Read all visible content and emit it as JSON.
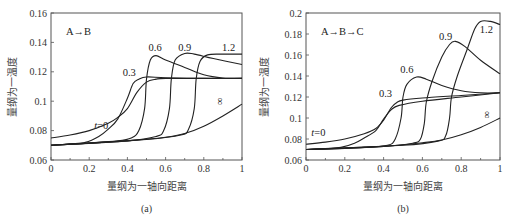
{
  "chart_data": [
    {
      "type": "line",
      "panel_label": "(a)",
      "annotation": "A→B",
      "xlabel": "量纲为一轴向距离",
      "ylabel": "量纲为一温度",
      "xlim": [
        0,
        1
      ],
      "ylim": [
        0.06,
        0.16
      ],
      "xticks": [
        "0",
        "0.2",
        "0.4",
        "0.6",
        "0.8",
        "1"
      ],
      "yticks": [
        "0.06",
        "0.08",
        "0.1",
        "0.12",
        "0.14",
        "0.16"
      ],
      "grid": false,
      "series": [
        {
          "name": "t=0",
          "label_pos": [
            0.3,
            0.081
          ],
          "points": [
            [
              0,
              0.075
            ],
            [
              0.1,
              0.077
            ],
            [
              0.2,
              0.08
            ],
            [
              0.3,
              0.085
            ],
            [
              0.35,
              0.089
            ],
            [
              0.4,
              0.095
            ],
            [
              0.45,
              0.106
            ],
            [
              0.5,
              0.113
            ],
            [
              0.55,
              0.115
            ],
            [
              0.6,
              0.1155
            ],
            [
              0.8,
              0.1155
            ],
            [
              1,
              0.1155
            ]
          ]
        },
        {
          "name": "0.3",
          "label_pos": [
            0.41,
            0.117
          ],
          "points": [
            [
              0,
              0.07
            ],
            [
              0.1,
              0.071
            ],
            [
              0.18,
              0.072
            ],
            [
              0.25,
              0.076
            ],
            [
              0.3,
              0.081
            ],
            [
              0.35,
              0.088
            ],
            [
              0.4,
              0.102
            ],
            [
              0.43,
              0.112
            ],
            [
              0.46,
              0.115
            ],
            [
              0.5,
              0.1165
            ],
            [
              0.6,
              0.116
            ],
            [
              0.8,
              0.1155
            ],
            [
              1,
              0.1155
            ]
          ]
        },
        {
          "name": "0.6",
          "label_pos": [
            0.545,
            0.134
          ],
          "points": [
            [
              0,
              0.07
            ],
            [
              0.2,
              0.0715
            ],
            [
              0.35,
              0.073
            ],
            [
              0.42,
              0.075
            ],
            [
              0.46,
              0.08
            ],
            [
              0.49,
              0.095
            ],
            [
              0.5,
              0.115
            ],
            [
              0.52,
              0.128
            ],
            [
              0.55,
              0.131
            ],
            [
              0.6,
              0.128
            ],
            [
              0.7,
              0.123
            ],
            [
              0.8,
              0.118
            ],
            [
              0.9,
              0.1158
            ],
            [
              1,
              0.1155
            ]
          ]
        },
        {
          "name": "0.9",
          "label_pos": [
            0.7,
            0.134
          ],
          "points": [
            [
              0,
              0.07
            ],
            [
              0.4,
              0.073
            ],
            [
              0.55,
              0.076
            ],
            [
              0.59,
              0.08
            ],
            [
              0.62,
              0.095
            ],
            [
              0.63,
              0.115
            ],
            [
              0.65,
              0.128
            ],
            [
              0.7,
              0.1325
            ],
            [
              0.75,
              0.132
            ],
            [
              0.85,
              0.129
            ],
            [
              1,
              0.125
            ]
          ]
        },
        {
          "name": "1.2",
          "label_pos": [
            0.93,
            0.134
          ],
          "points": [
            [
              0,
              0.07
            ],
            [
              0.5,
              0.074
            ],
            [
              0.68,
              0.077
            ],
            [
              0.72,
              0.081
            ],
            [
              0.75,
              0.095
            ],
            [
              0.76,
              0.115
            ],
            [
              0.78,
              0.127
            ],
            [
              0.82,
              0.1315
            ],
            [
              0.9,
              0.132
            ],
            [
              1,
              0.132
            ]
          ]
        },
        {
          "name": "∞",
          "label_pos": [
            0.9,
            0.1
          ],
          "points": [
            [
              0,
              0.07
            ],
            [
              0.2,
              0.0715
            ],
            [
              0.4,
              0.073
            ],
            [
              0.6,
              0.0755
            ],
            [
              0.7,
              0.078
            ],
            [
              0.8,
              0.083
            ],
            [
              0.9,
              0.09
            ],
            [
              1,
              0.098
            ]
          ]
        }
      ]
    },
    {
      "type": "line",
      "panel_label": "(b)",
      "annotation": "A→B→C",
      "xlabel": "量纲为一轴向距离",
      "ylabel": "量纲为一温度",
      "xlim": [
        0,
        1
      ],
      "ylim": [
        0.06,
        0.2
      ],
      "xticks": [
        "0",
        "0.2",
        "0.4",
        "0.6",
        "0.8",
        "1"
      ],
      "yticks": [
        "0.06",
        "0.08",
        "0.1",
        "0.12",
        "0.14",
        "0.16",
        "0.18",
        "0.2"
      ],
      "grid": false,
      "series": [
        {
          "name": "t=0",
          "label_pos": [
            0.1,
            0.083
          ],
          "points": [
            [
              0,
              0.075
            ],
            [
              0.1,
              0.077
            ],
            [
              0.2,
              0.08
            ],
            [
              0.3,
              0.085
            ],
            [
              0.36,
              0.09
            ],
            [
              0.4,
              0.098
            ],
            [
              0.44,
              0.11
            ],
            [
              0.47,
              0.115
            ],
            [
              0.5,
              0.117
            ],
            [
              0.6,
              0.119
            ],
            [
              0.8,
              0.1215
            ],
            [
              1,
              0.124
            ]
          ]
        },
        {
          "name": "0.3",
          "label_pos": [
            0.41,
            0.12
          ],
          "points": [
            [
              0,
              0.07
            ],
            [
              0.1,
              0.071
            ],
            [
              0.18,
              0.072
            ],
            [
              0.25,
              0.076
            ],
            [
              0.3,
              0.081
            ],
            [
              0.36,
              0.088
            ],
            [
              0.4,
              0.099
            ],
            [
              0.44,
              0.108
            ],
            [
              0.48,
              0.112
            ],
            [
              0.6,
              0.116
            ],
            [
              0.8,
              0.12
            ],
            [
              1,
              0.124
            ]
          ]
        },
        {
          "name": "0.6",
          "label_pos": [
            0.52,
            0.143
          ],
          "points": [
            [
              0,
              0.07
            ],
            [
              0.3,
              0.072
            ],
            [
              0.42,
              0.074
            ],
            [
              0.46,
              0.08
            ],
            [
              0.49,
              0.1
            ],
            [
              0.5,
              0.12
            ],
            [
              0.52,
              0.132
            ],
            [
              0.57,
              0.139
            ],
            [
              0.62,
              0.137
            ],
            [
              0.7,
              0.131
            ],
            [
              0.8,
              0.126
            ],
            [
              0.9,
              0.124
            ],
            [
              1,
              0.124
            ]
          ]
        },
        {
          "name": "0.9",
          "label_pos": [
            0.72,
            0.174
          ],
          "points": [
            [
              0,
              0.07
            ],
            [
              0.4,
              0.073
            ],
            [
              0.55,
              0.076
            ],
            [
              0.59,
              0.08
            ],
            [
              0.61,
              0.095
            ],
            [
              0.62,
              0.115
            ],
            [
              0.65,
              0.135
            ],
            [
              0.7,
              0.158
            ],
            [
              0.74,
              0.17
            ],
            [
              0.77,
              0.173
            ],
            [
              0.82,
              0.168
            ],
            [
              0.9,
              0.155
            ],
            [
              1,
              0.142
            ]
          ]
        },
        {
          "name": "1.2",
          "label_pos": [
            0.93,
            0.181
          ],
          "points": [
            [
              0,
              0.07
            ],
            [
              0.5,
              0.074
            ],
            [
              0.68,
              0.078
            ],
            [
              0.72,
              0.083
            ],
            [
              0.74,
              0.1
            ],
            [
              0.75,
              0.12
            ],
            [
              0.78,
              0.14
            ],
            [
              0.83,
              0.165
            ],
            [
              0.87,
              0.185
            ],
            [
              0.9,
              0.192
            ],
            [
              0.95,
              0.192
            ],
            [
              1,
              0.189
            ]
          ]
        },
        {
          "name": "∞",
          "label_pos": [
            0.95,
            0.103
          ],
          "points": [
            [
              0,
              0.07
            ],
            [
              0.2,
              0.071
            ],
            [
              0.4,
              0.073
            ],
            [
              0.6,
              0.0765
            ],
            [
              0.7,
              0.079
            ],
            [
              0.8,
              0.084
            ],
            [
              0.9,
              0.091
            ],
            [
              1,
              0.1
            ]
          ]
        }
      ]
    }
  ]
}
